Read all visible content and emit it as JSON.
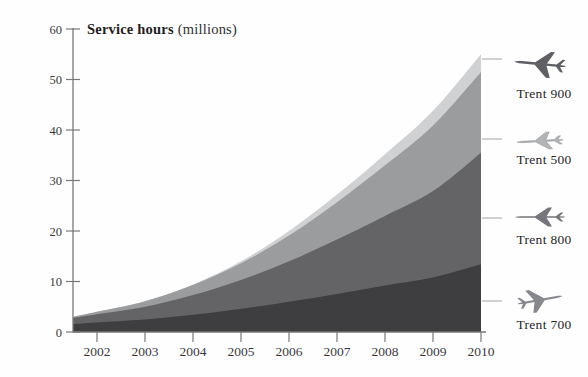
{
  "title": {
    "main": "Service hours",
    "unit": "(millions)"
  },
  "chart_data": {
    "type": "area",
    "stacked": true,
    "ylabel": "Service hours (millions)",
    "xlabel": "",
    "grid": false,
    "legend_position": "right",
    "xlim": [
      2001.5,
      2010
    ],
    "ylim": [
      0,
      60
    ],
    "x": [
      2001.5,
      2002,
      2003,
      2004,
      2005,
      2006,
      2007,
      2008,
      2009,
      2010
    ],
    "x_tick_labels": [
      "2002",
      "2003",
      "2004",
      "2005",
      "2006",
      "2007",
      "2008",
      "2009",
      "2010"
    ],
    "y_tick_labels": [
      "0",
      "10",
      "20",
      "30",
      "40",
      "50",
      "60"
    ],
    "series": [
      {
        "name": "Trent 700",
        "color": "#3e3e41",
        "values": [
          1.6,
          1.9,
          2.5,
          3.4,
          4.6,
          6.0,
          7.5,
          9.2,
          10.8,
          13.4
        ]
      },
      {
        "name": "Trent 800",
        "color": "#646467",
        "values": [
          1.2,
          1.6,
          2.5,
          3.9,
          5.7,
          8.0,
          10.8,
          13.8,
          17.1,
          22.1
        ]
      },
      {
        "name": "Trent 500",
        "color": "#9b9c9e",
        "values": [
          0.2,
          0.5,
          1.1,
          2.0,
          3.3,
          5.1,
          7.4,
          10.0,
          13.0,
          16.0
        ]
      },
      {
        "name": "Trent 900",
        "color": "#d0d1d3",
        "values": [
          0.0,
          0.0,
          0.0,
          0.1,
          0.4,
          0.9,
          1.5,
          2.2,
          2.9,
          3.5
        ]
      }
    ]
  },
  "legend": {
    "items": [
      {
        "label": "Trent 900"
      },
      {
        "label": "Trent 500"
      },
      {
        "label": "Trent 800"
      },
      {
        "label": "Trent 700"
      }
    ]
  },
  "colors": {
    "axis": "#787878",
    "text": "#3a3a3a",
    "leader_line": "#9a9a9a",
    "background": "#ffffff"
  }
}
